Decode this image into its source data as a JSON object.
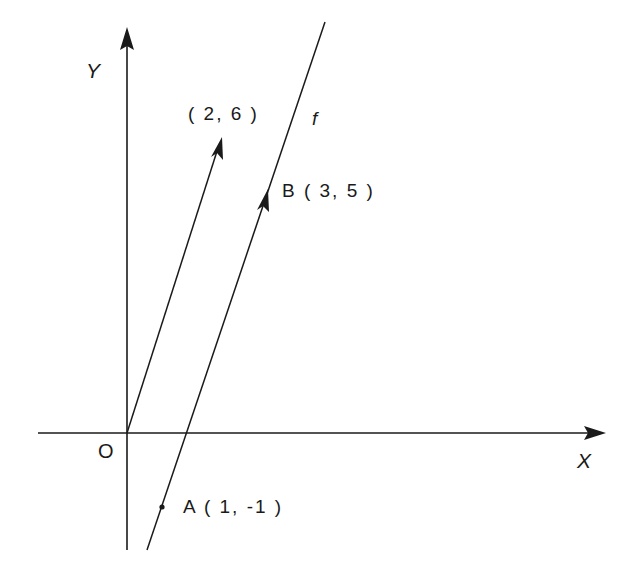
{
  "diagram": {
    "title": "",
    "axes": {
      "x_label": "X",
      "y_label": "Y",
      "origin_label": "O"
    },
    "line": {
      "name": "f"
    },
    "points": {
      "A": {
        "label": "A ( 1, -1 )",
        "x": 1,
        "y": -1
      },
      "B": {
        "label": "B ( 3, 5 )",
        "x": 3,
        "y": 5
      }
    },
    "vectors": [
      {
        "label": "( 2, 6 )",
        "from": [
          0,
          0
        ],
        "to": [
          2,
          6
        ],
        "description": "position vector from origin"
      },
      {
        "label": "",
        "from": [
          1,
          -1
        ],
        "to": [
          3,
          5
        ],
        "description": "vector AB along line f"
      }
    ],
    "colors": {
      "stroke": "#1a1a1a",
      "background": "#ffffff"
    }
  }
}
